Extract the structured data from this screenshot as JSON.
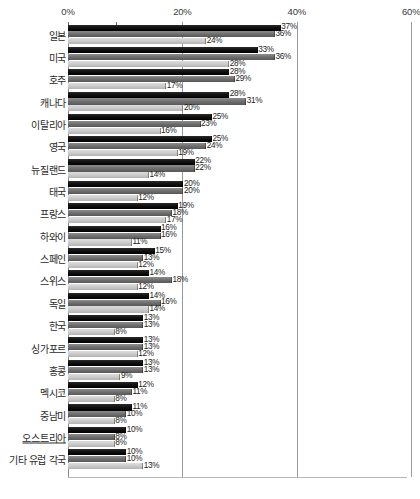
{
  "chart_data": {
    "type": "bar",
    "orientation": "horizontal",
    "title": "",
    "xlabel": "",
    "ylabel": "",
    "xlim": [
      0,
      60
    ],
    "xticks": [
      "0%",
      "20%",
      "40%",
      "60%"
    ],
    "xtick_values": [
      0,
      20,
      40,
      60
    ],
    "grid": true,
    "legend": "none",
    "value_suffix": "%",
    "series": [
      {
        "name": "series-1",
        "color": "#000000",
        "values": [
          37,
          33,
          28,
          28,
          25,
          25,
          22,
          20,
          19,
          16,
          15,
          14,
          14,
          13,
          13,
          13,
          12,
          11,
          10,
          10
        ]
      },
      {
        "name": "series-2",
        "color": "#6e6e6e",
        "values": [
          36,
          36,
          29,
          31,
          23,
          24,
          22,
          20,
          18,
          16,
          13,
          18,
          16,
          13,
          13,
          13,
          11,
          10,
          8,
          10
        ]
      },
      {
        "name": "series-3",
        "color": "#c9c9c9",
        "values": [
          24,
          28,
          17,
          20,
          16,
          19,
          14,
          12,
          17,
          11,
          12,
          12,
          14,
          8,
          12,
          9,
          8,
          8,
          8,
          13
        ]
      }
    ],
    "categories": [
      "일본",
      "미국",
      "호주",
      "캐나다",
      "이탈리아",
      "영국",
      "뉴질랜드",
      "태국",
      "프랑스",
      "하와이",
      "스페인",
      "스위스",
      "독일",
      "한국",
      "싱가포르",
      "홍콩",
      "멕시코",
      "중남미",
      "오스트리아",
      "기타 유럽 각국"
    ],
    "category_styles": [
      "normal",
      "normal",
      "normal",
      "normal",
      "normal",
      "normal",
      "normal",
      "normal",
      "normal",
      "normal",
      "normal",
      "normal",
      "normal",
      "normal",
      "normal",
      "normal",
      "normal",
      "normal",
      "underlined",
      "normal"
    ],
    "labels": {
      "series-1": [
        "37%",
        "33%",
        "28%",
        "28%",
        "25%",
        "25%",
        "22%",
        "20%",
        "19%",
        "16%",
        "15%",
        "14%",
        "14%",
        "13%",
        "13%",
        "13%",
        "12%",
        "11%",
        "10%",
        "10%"
      ],
      "series-2": [
        "36%",
        "36%",
        "29%",
        "31%",
        "23%",
        "24%",
        "22%",
        "20%",
        "18%",
        "16%",
        "13%",
        "18%",
        "16%",
        "13%",
        "13%",
        "13%",
        "11%",
        "10%",
        "8%",
        "10%"
      ],
      "series-3": [
        "24%",
        "28%",
        "17%",
        "20%",
        "16%",
        "19%",
        "14%",
        "12%",
        "17%",
        "11%",
        "12%",
        "12%",
        "14%",
        "8%",
        "12%",
        "9%",
        "8%",
        "8%",
        "8%",
        "13%"
      ]
    }
  },
  "colors": {
    "series1": "#000000",
    "series2": "#6e6e6e",
    "series3": "#c9c9c9",
    "gridline": "#9a9a9a",
    "text": "#2a2a2a",
    "background": "#ffffff"
  }
}
